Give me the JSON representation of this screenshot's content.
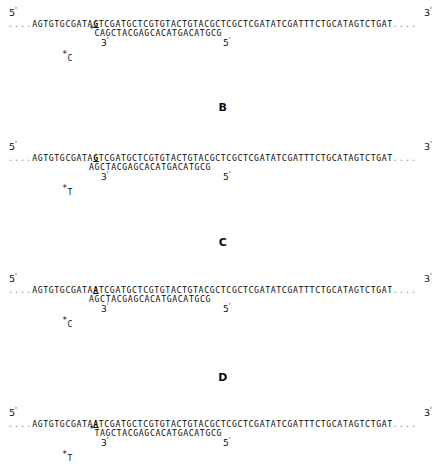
{
  "figure": {
    "panel_letters": [
      "B",
      "C",
      "D"
    ],
    "end_labels": {
      "left": "5",
      "right": "3",
      "prime": "'"
    },
    "sub_labels": {
      "three": "3",
      "five": "5"
    }
  },
  "panels": [
    {
      "id": "panel-a",
      "top_strand": {
        "leading_dots": "....",
        "prefix": "AGTGTGCGATA",
        "marked_base": "G",
        "suffix": "TCGATGCTCGTGTACTGTACGCTCGCTCGATATCGATTTCTGCATAGTCTGAT",
        "trailing_dots": "...."
      },
      "bottom_strand": {
        "star": "*",
        "sequence": "CAGCTACGAGCACATGACATGCG"
      },
      "free_base": {
        "star": "*",
        "base": "C"
      },
      "letter_below": "B"
    },
    {
      "id": "panel-b",
      "top_strand": {
        "leading_dots": "....",
        "prefix": "AGTGTGCGATA",
        "marked_base": "G",
        "suffix": "TCGATGCTCGTGTACTGTACGCTCGCTCGATATCGATTTCTGCATAGTCTGAT",
        "trailing_dots": "...."
      },
      "bottom_strand": {
        "star": "",
        "sequence": "AGCTACGAGCACATGACATGCG"
      },
      "free_base": {
        "star": "*",
        "base": "T"
      },
      "letter_below": "C"
    },
    {
      "id": "panel-c",
      "top_strand": {
        "leading_dots": "....",
        "prefix": "AGTGTGCGATA",
        "marked_base": "A",
        "suffix": "TCGATGCTCGTGTACTGTACGCTCGCTCGATATCGATTTCTGCATAGTCTGAT",
        "trailing_dots": "...."
      },
      "bottom_strand": {
        "star": "",
        "sequence": "AGCTACGAGCACATGACATGCG"
      },
      "free_base": {
        "star": "*",
        "base": "C"
      },
      "letter_below": "D"
    },
    {
      "id": "panel-d",
      "top_strand": {
        "leading_dots": "....",
        "prefix": "AGTGTGCGATA",
        "marked_base": "A",
        "suffix": "TCGATGCTCGTGTACTGTACGCTCGCTCGATATCGATTTCTGCATAGTCTGAT",
        "trailing_dots": "...."
      },
      "bottom_strand": {
        "star": "*",
        "sequence": "TAGCTACGAGCACATGACATGCG"
      },
      "free_base": {
        "star": "*",
        "base": "T"
      },
      "letter_below": ""
    }
  ]
}
